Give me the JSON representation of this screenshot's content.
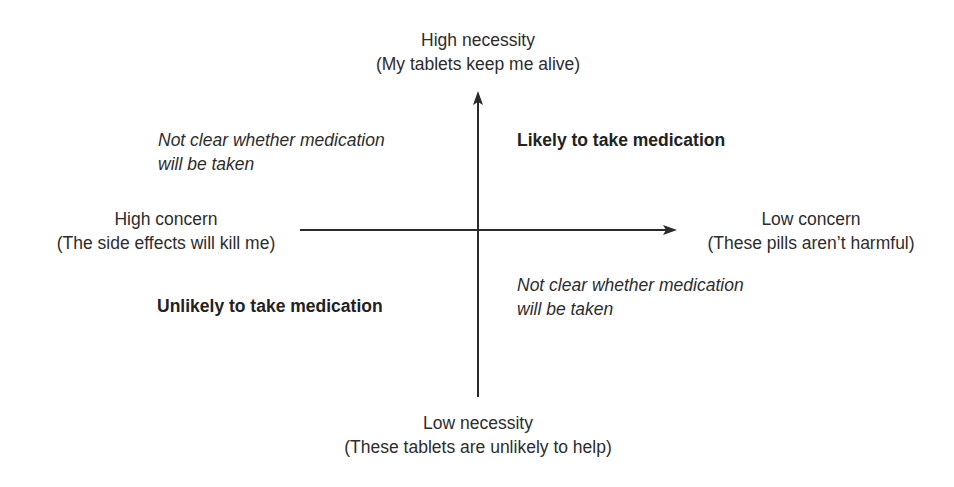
{
  "diagram": {
    "type": "quadrant",
    "axes": {
      "vertical": {
        "top_label": {
          "title": "High necessity",
          "example": "(My tablets keep me alive)"
        },
        "bottom_label": {
          "title": "Low necessity",
          "example": "(These tablets are unlikely to help)"
        }
      },
      "horizontal": {
        "left_label": {
          "title": "High concern",
          "example": "(The side effects will kill me)"
        },
        "right_label": {
          "title": "Low concern",
          "example": "(These pills aren’t harmful)"
        }
      }
    },
    "quadrants": {
      "top_left": {
        "lines": [
          "Not clear whether medication",
          "will be taken"
        ],
        "style": "italic"
      },
      "top_right": {
        "lines": [
          "Likely to take medication"
        ],
        "style": "bold"
      },
      "bottom_left": {
        "lines": [
          "Unlikely to take medication"
        ],
        "style": "bold"
      },
      "bottom_right": {
        "lines": [
          "Not clear whether medication",
          "will be taken"
        ],
        "style": "italic"
      }
    },
    "colors": {
      "background": "#ffffff",
      "axis": "#2a2a2a",
      "text": "#2d2d2d"
    }
  }
}
